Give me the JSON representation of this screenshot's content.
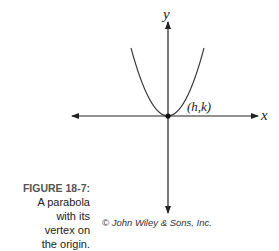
{
  "figure": {
    "label": "FIGURE 18-7:",
    "caption_lines": [
      "A parabola",
      "with its",
      "vertex on",
      "the origin."
    ],
    "credit": "© John Wiley & Sons, Inc."
  },
  "diagram": {
    "x_axis_label": "x",
    "y_axis_label": "y",
    "vertex_label": "(h,k)",
    "curve": "parabola opening upward, vertex at origin"
  }
}
